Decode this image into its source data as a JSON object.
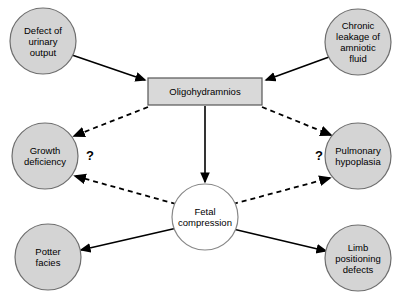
{
  "diagram": {
    "colors": {
      "node_fill": "#d4d4d4",
      "node_stroke": "#6e6e6e",
      "box_fill": "#d9d9d9",
      "box_stroke": "#555555",
      "center_fill": "#ffffff",
      "center_stroke": "#888888",
      "arrow": "#000000",
      "background": "#ffffff"
    },
    "nodes": [
      {
        "id": "defect-of-urinary-output",
        "label": "Defect of\nurinary\noutput",
        "shape": "circle",
        "cx": 43,
        "cy": 41,
        "r": 33,
        "fill": "#d4d4d4"
      },
      {
        "id": "chronic-leakage-of-amniotic-fluid",
        "label": "Chronic\nleakage of\namniotic\nfluid",
        "shape": "circle",
        "cx": 358,
        "cy": 42,
        "r": 33,
        "fill": "#d4d4d4"
      },
      {
        "id": "oligohydramnios",
        "label": "Oligohydramnios",
        "shape": "rect",
        "x": 148,
        "y": 78,
        "width": 114,
        "height": 27,
        "fill": "#d9d9d9"
      },
      {
        "id": "growth-deficiency",
        "label": "Growth\ndeficiency",
        "shape": "circle",
        "cx": 45,
        "cy": 156,
        "r": 33,
        "fill": "#d4d4d4"
      },
      {
        "id": "pulmonary-hypoplasia",
        "label": "Pulmonary\nhypoplasia",
        "shape": "circle",
        "cx": 358,
        "cy": 156,
        "r": 33,
        "fill": "#d4d4d4"
      },
      {
        "id": "fetal-compression",
        "label": "Fetal\ncompression",
        "shape": "circle",
        "cx": 205,
        "cy": 217,
        "r": 33,
        "fill": "#ffffff"
      },
      {
        "id": "potter-facies",
        "label": "Potter\nfacies",
        "shape": "circle",
        "cx": 48,
        "cy": 257,
        "r": 33,
        "fill": "#d4d4d4"
      },
      {
        "id": "limb-positioning-defects",
        "label": "Limb\npositioning\ndefects",
        "shape": "circle",
        "cx": 358,
        "cy": 258,
        "r": 33,
        "fill": "#d4d4d4"
      }
    ],
    "edges": [
      {
        "id": "defect-to-oligohydramnios",
        "from": "defect-of-urinary-output",
        "to": "oligohydramnios",
        "style": "solid",
        "x1": 72,
        "y1": 55,
        "x2": 145,
        "y2": 80
      },
      {
        "id": "leakage-to-oligohydramnios",
        "from": "chronic-leakage-of-amniotic-fluid",
        "to": "oligohydramnios",
        "style": "solid",
        "x1": 329,
        "y1": 57,
        "x2": 266,
        "y2": 80
      },
      {
        "id": "oligohydramnios-to-growth-deficiency",
        "from": "oligohydramnios",
        "to": "growth-deficiency",
        "style": "dashed",
        "x1": 148,
        "y1": 107,
        "x2": 74,
        "y2": 136
      },
      {
        "id": "oligohydramnios-to-pulmonary-hypoplasia",
        "from": "oligohydramnios",
        "to": "pulmonary-hypoplasia",
        "style": "dashed",
        "x1": 262,
        "y1": 107,
        "x2": 331,
        "y2": 135
      },
      {
        "id": "oligohydramnios-to-fetal-compression",
        "from": "oligohydramnios",
        "to": "fetal-compression",
        "style": "solid",
        "x1": 205,
        "y1": 106,
        "x2": 205,
        "y2": 182
      },
      {
        "id": "fetal-compression-to-growth-deficiency",
        "from": "fetal-compression",
        "to": "growth-deficiency",
        "style": "dashed",
        "x1": 176,
        "y1": 204,
        "x2": 75,
        "y2": 176
      },
      {
        "id": "fetal-compression-to-pulmonary-hypoplasia",
        "from": "fetal-compression",
        "to": "pulmonary-hypoplasia",
        "style": "dashed",
        "x1": 233,
        "y1": 204,
        "x2": 330,
        "y2": 178
      },
      {
        "id": "fetal-compression-to-potter-facies",
        "from": "fetal-compression",
        "to": "potter-facies",
        "style": "solid",
        "x1": 177,
        "y1": 228,
        "x2": 81,
        "y2": 250
      },
      {
        "id": "fetal-compression-to-limb-positioning-defects",
        "from": "fetal-compression",
        "to": "limb-positioning-defects",
        "style": "solid",
        "x1": 233,
        "y1": 229,
        "x2": 326,
        "y2": 251
      }
    ],
    "annotations": [
      {
        "id": "question-mark-left",
        "text": "?",
        "x": 86,
        "y": 148
      },
      {
        "id": "question-mark-right",
        "text": "?",
        "x": 315,
        "y": 148
      }
    ]
  }
}
